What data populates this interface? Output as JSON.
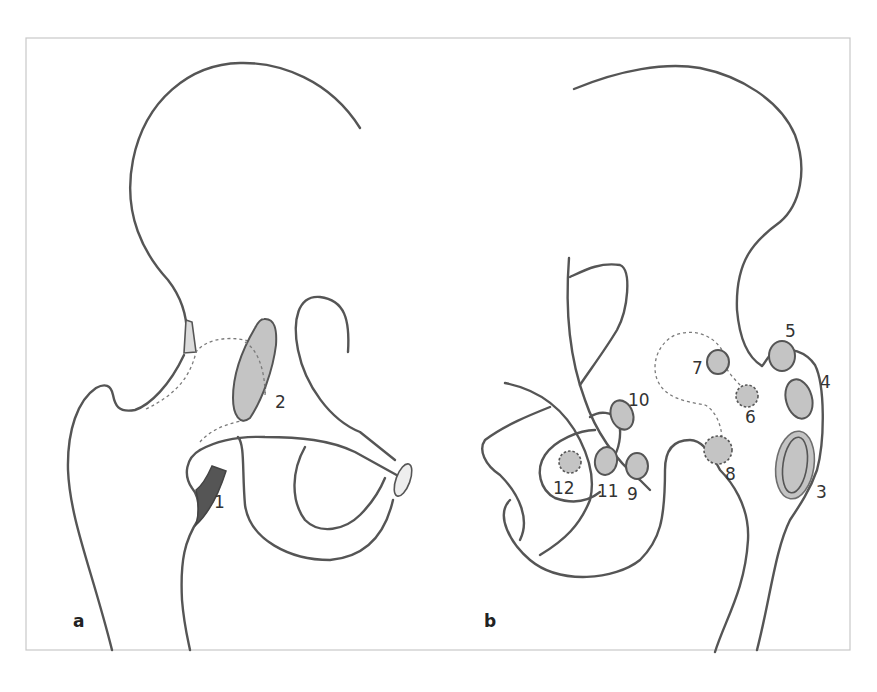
{
  "figure": {
    "panels": [
      {
        "id": "a",
        "label": "a",
        "markers": [
          {
            "number": "1",
            "style": "dark-filled",
            "x": 212,
            "y": 506
          },
          {
            "number": "2",
            "style": "gray-filled",
            "x": 274,
            "y": 406
          }
        ]
      },
      {
        "id": "b",
        "label": "b",
        "markers": [
          {
            "number": "3",
            "style": "gray-ring",
            "x": 812,
            "y": 500
          },
          {
            "number": "4",
            "style": "gray-filled",
            "x": 818,
            "y": 390
          },
          {
            "number": "5",
            "style": "gray-filled",
            "x": 785,
            "y": 339
          },
          {
            "number": "6",
            "style": "gray-dashed",
            "x": 745,
            "y": 422
          },
          {
            "number": "7",
            "style": "gray-filled",
            "x": 694,
            "y": 373
          },
          {
            "number": "8",
            "style": "gray-dashed",
            "x": 726,
            "y": 478
          },
          {
            "number": "9",
            "style": "gray-filled",
            "x": 625,
            "y": 500
          },
          {
            "number": "10",
            "style": "gray-filled",
            "x": 627,
            "y": 405
          },
          {
            "number": "11",
            "style": "gray-filled",
            "x": 598,
            "y": 496
          },
          {
            "number": "12",
            "style": "gray-dashed",
            "x": 555,
            "y": 492
          }
        ]
      }
    ],
    "colors": {
      "outline": "#555555",
      "lesion_fill": "#c4c4c4",
      "dark_fill": "#555555",
      "frame": "#c8c8c8",
      "background": "#ffffff"
    }
  }
}
